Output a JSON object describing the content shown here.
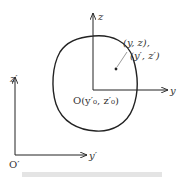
{
  "diagram": {
    "type": "coordinate-transformation",
    "colors": {
      "stroke": "#222222",
      "text": "#333333",
      "caption_blur": "#dcdcdc"
    },
    "axes_local": {
      "origin_label": "O(y′₀, z′₀)",
      "y_label": "y",
      "z_label": "z"
    },
    "axes_global": {
      "origin_label": "O′",
      "y_label": "y′",
      "z_label": "z′"
    },
    "point": {
      "label_line1": "(y, z),",
      "label_line2": "(y′, z′)"
    },
    "region": {
      "shape": "closed-curve"
    }
  }
}
